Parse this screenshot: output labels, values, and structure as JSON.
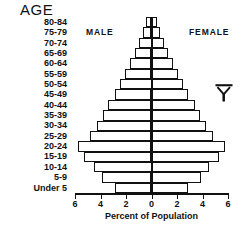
{
  "title": "AGE",
  "labels": {
    "male": "MALE",
    "female": "FEMALE",
    "axis_caption": "Percent of Population",
    "symbol_name": "y-overbar-symbol"
  },
  "axis": {
    "ticks": [
      "6",
      "4",
      "2",
      "0",
      "2",
      "4",
      "6"
    ],
    "tick_values": [
      -6,
      -4,
      -2,
      0,
      2,
      4,
      6
    ],
    "min": -6,
    "max": 6
  },
  "chart_data": {
    "type": "bar",
    "subtype": "population-pyramid",
    "title": "AGE",
    "xlabel": "Percent of Population",
    "ylabel": "AGE",
    "xlim": [
      -6,
      6
    ],
    "xtick_labels": [
      "6",
      "4",
      "2",
      "0",
      "2",
      "4",
      "6"
    ],
    "grid": false,
    "legend": [
      "MALE",
      "FEMALE"
    ],
    "legend_position": "inside-top",
    "categories": [
      "80-84",
      "75-79",
      "70-74",
      "65-69",
      "60-64",
      "55-59",
      "50-54",
      "45-49",
      "40-44",
      "35-39",
      "30-34",
      "25-29",
      "20-24",
      "15-19",
      "10-14",
      "5-9",
      "Under 5"
    ],
    "series": [
      {
        "name": "MALE",
        "side": "left",
        "values": [
          0.4,
          0.7,
          1.0,
          1.3,
          1.7,
          2.1,
          2.5,
          2.9,
          3.4,
          3.8,
          4.3,
          4.8,
          5.8,
          5.3,
          4.5,
          3.9,
          2.9
        ]
      },
      {
        "name": "FEMALE",
        "side": "right",
        "values": [
          0.4,
          0.7,
          1.0,
          1.3,
          1.7,
          2.1,
          2.5,
          2.9,
          3.4,
          3.8,
          4.3,
          4.8,
          5.8,
          5.3,
          4.5,
          3.9,
          2.9
        ]
      }
    ]
  },
  "colors": {
    "ink": "#111111",
    "background": "#ffffff",
    "bar_fill": "#ffffff"
  }
}
